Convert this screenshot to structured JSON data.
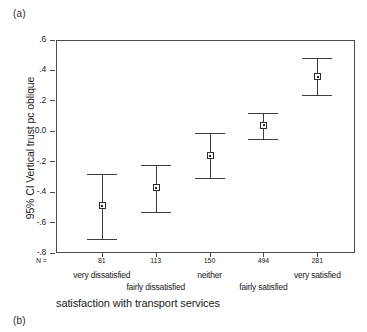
{
  "panels": {
    "a_label": "(a)",
    "b_label": "(b)"
  },
  "chart_data": {
    "type": "scatter",
    "title": "",
    "xlabel": "satisfaction with transport services",
    "ylabel": "95% CI Vertical trust  pc oblique",
    "ylim": [
      -0.8,
      0.6
    ],
    "yticks": [
      0.6,
      0.4,
      0.2,
      0.0,
      -0.2,
      -0.4,
      -0.6,
      -0.8
    ],
    "ytick_labels": [
      ".6",
      ".4",
      ".2",
      "0.0",
      "-.2",
      "-.4",
      "-.6",
      "-.8"
    ],
    "grid": false,
    "legend": "none",
    "n_row_label": "N =",
    "categories": [
      "very dissatisfied",
      "fairly dissatisfied",
      "neither",
      "fairly satisfied",
      "very satisfied"
    ],
    "n_values": [
      81,
      113,
      150,
      494,
      281
    ],
    "values": [
      -0.49,
      -0.37,
      -0.16,
      0.04,
      0.36
    ],
    "ci_lower": [
      -0.71,
      -0.53,
      -0.31,
      -0.05,
      0.24
    ],
    "ci_upper": [
      -0.28,
      -0.22,
      -0.01,
      0.12,
      0.48
    ],
    "marker": "open-square",
    "error_color": "#3d3d3d",
    "axis_color": "#4a4a4a"
  }
}
